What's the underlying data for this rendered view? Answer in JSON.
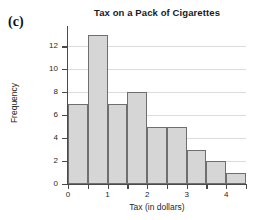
{
  "figure": {
    "panel_label": "(c)",
    "background_color": "#ffffff"
  },
  "chart_data": {
    "type": "bar",
    "title": "Tax on a Pack of Cigarettes",
    "xlabel": "Tax (in dollars)",
    "ylabel": "Frequency",
    "categories": [
      "0.0-0.5",
      "0.5-1.0",
      "1.0-1.5",
      "1.5-2.0",
      "2.0-2.5",
      "2.5-3.0",
      "3.0-3.5",
      "3.5-4.0",
      "4.0-4.5"
    ],
    "bin_edges": [
      0,
      0.5,
      1,
      1.5,
      2,
      2.5,
      3,
      3.5,
      4,
      4.5
    ],
    "values": [
      7,
      13,
      7,
      8,
      5,
      5,
      3,
      2,
      1
    ],
    "xlim": [
      0,
      4.5
    ],
    "ylim": [
      0,
      13.6
    ],
    "x_tick_values": [
      0,
      0.5,
      1,
      1.5,
      2,
      2.5,
      3,
      3.5,
      4,
      4.5
    ],
    "x_tick_labels": [
      "0",
      "",
      "1",
      "",
      "2",
      "",
      "3",
      "",
      "4",
      ""
    ],
    "y_tick_values": [
      0,
      2,
      4,
      6,
      8,
      10,
      12
    ],
    "y_tick_labels": [
      "0",
      "2",
      "4",
      "6",
      "8",
      "10",
      "12"
    ],
    "grid": "horizontal",
    "grid_color": "#dcdcdc",
    "bar_fill_color": "#d6d6d6",
    "bar_edge_color": "#6f6f6f",
    "axis_color": "#4a4a4a",
    "legend": null
  }
}
